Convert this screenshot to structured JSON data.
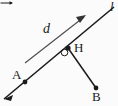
{
  "figure": {
    "type": "geometry-diagram",
    "background_color": "#fbfbfb",
    "stroke_color": "#1b1b1b",
    "labels": {
      "line": "l",
      "point_a": "A",
      "point_b": "B",
      "point_h": "H",
      "vector": "d"
    },
    "elements": {
      "line_l": {
        "name": "line-l",
        "from": [
          4,
          99
        ],
        "to": [
          114,
          7
        ],
        "arrow_at_start": true
      },
      "segment_hb": {
        "name": "segment-h-b",
        "from": [
          68,
          48
        ],
        "to": [
          96,
          88
        ]
      },
      "vector_d": {
        "name": "vector-d",
        "from": [
          25,
          63
        ],
        "to": [
          86,
          16
        ],
        "arrow_at_end": true
      },
      "right_angle": {
        "name": "right-angle-marker",
        "at": [
          68,
          48
        ]
      },
      "points": [
        {
          "name": "point-a",
          "label": "A",
          "x": 25,
          "y": 82
        },
        {
          "name": "point-h",
          "label": "H",
          "x": 68,
          "y": 48
        },
        {
          "name": "point-b",
          "label": "B",
          "x": 96,
          "y": 88
        }
      ]
    }
  }
}
